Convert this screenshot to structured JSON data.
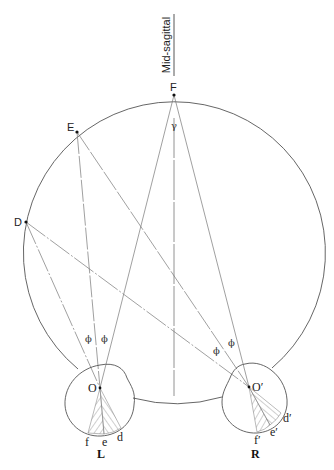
{
  "diagram": {
    "title_label": "Mid-sagittal",
    "points": {
      "F": "F",
      "E": "E",
      "D": "D",
      "O": "O",
      "O_prime": "O′"
    },
    "angle_labels": {
      "gamma": "γ",
      "phi": "ϕ"
    },
    "left_eye": {
      "label": "L",
      "retina_points": [
        "f",
        "e",
        "d"
      ]
    },
    "right_eye": {
      "label": "R",
      "retina_points": [
        "f′",
        "e′",
        "d′"
      ]
    },
    "colors": {
      "line": "#555555",
      "hatch": "#888888",
      "background": "#ffffff"
    }
  }
}
